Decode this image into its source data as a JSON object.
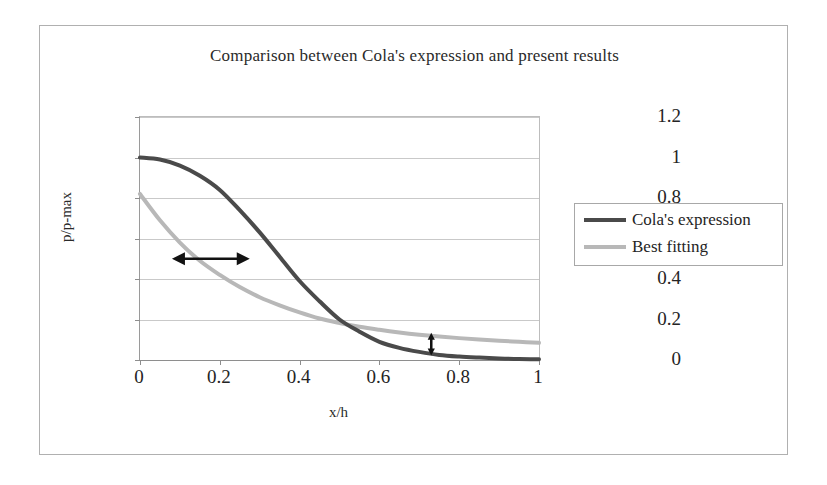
{
  "chart_data": {
    "type": "line",
    "title": "Comparison between Cola's expression and present results",
    "xlabel": "x/h",
    "ylabel": "p/p-max",
    "xlim": [
      0,
      1
    ],
    "ylim": [
      0,
      1.2
    ],
    "grid": "horizontal",
    "legend_position": "right",
    "x_ticks": [
      "0",
      "0.2",
      "0.4",
      "0.6",
      "0.8",
      "1"
    ],
    "x_tick_values": [
      0,
      0.2,
      0.4,
      0.6,
      0.8,
      1
    ],
    "y_ticks": [
      "0",
      "0.2",
      "0.4",
      "0.6",
      "0.8",
      "1",
      "1.2"
    ],
    "y_tick_values": [
      0,
      0.2,
      0.4,
      0.6,
      0.8,
      1,
      1.2
    ],
    "x": [
      0,
      0.05,
      0.1,
      0.15,
      0.2,
      0.25,
      0.3,
      0.35,
      0.4,
      0.45,
      0.5,
      0.55,
      0.6,
      0.65,
      0.7,
      0.75,
      0.8,
      0.85,
      0.9,
      0.95,
      1
    ],
    "series": [
      {
        "name": "Cola's expression",
        "color": "#4a4a4a",
        "width": 4,
        "values": [
          1.0,
          0.99,
          0.96,
          0.91,
          0.84,
          0.74,
          0.63,
          0.51,
          0.39,
          0.29,
          0.2,
          0.14,
          0.09,
          0.06,
          0.04,
          0.025,
          0.017,
          0.012,
          0.008,
          0.005,
          0.004
        ]
      },
      {
        "name": "Best fitting",
        "color": "#b8b8b8",
        "width": 4,
        "values": [
          0.82,
          0.69,
          0.58,
          0.49,
          0.42,
          0.36,
          0.31,
          0.27,
          0.235,
          0.205,
          0.183,
          0.164,
          0.149,
          0.136,
          0.125,
          0.116,
          0.108,
          0.101,
          0.095,
          0.09,
          0.085
        ]
      }
    ],
    "annotations": [
      {
        "name": "horizontal-span-arrow",
        "type": "double-arrow-horizontal",
        "x_start": 0.08,
        "x_end": 0.275,
        "y": 0.5,
        "color": "#121212"
      },
      {
        "name": "vertical-gap-arrow",
        "type": "double-arrow-vertical",
        "x": 0.73,
        "y_start": 0.022,
        "y_end": 0.135,
        "color": "#121212"
      }
    ]
  },
  "legend": {
    "entries": [
      {
        "label": "Cola's expression"
      },
      {
        "label": "Best fitting"
      }
    ]
  }
}
